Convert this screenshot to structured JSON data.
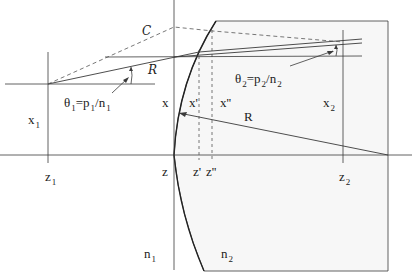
{
  "diagram": {
    "colors": {
      "line": "#3a3a3a",
      "dashed": "#555555",
      "medium2_fill": "#f7f7f7",
      "background": "#ffffff"
    },
    "labels": {
      "C": "C",
      "R_script": "R",
      "theta1": {
        "base": "θ",
        "sub": "1",
        "eq": "=p",
        "psub": "1",
        "slash": "/n",
        "nsub": "1"
      },
      "theta2": {
        "base": "θ",
        "sub": "2",
        "eq": "=p",
        "psub": "2",
        "slash": "/n",
        "nsub": "2"
      },
      "x1": {
        "base": "x",
        "sub": "1"
      },
      "x2": {
        "base": "x",
        "sub": "2"
      },
      "x": "x",
      "x_prime": "x'",
      "x_dprime": "x''",
      "R": "R",
      "z1": {
        "base": "z",
        "sub": "1"
      },
      "z": "z",
      "z_prime": "z'",
      "z_dprime": "z''",
      "z2": {
        "base": "z",
        "sub": "2"
      },
      "n1": {
        "base": "n",
        "sub": "1"
      },
      "n2": {
        "base": "n",
        "sub": "2"
      }
    }
  }
}
